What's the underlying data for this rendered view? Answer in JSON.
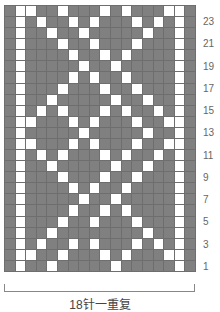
{
  "chart": {
    "columns": 18,
    "rows": 24,
    "colors": {
      "knit": "#808080",
      "contrast": "#ffffff",
      "grid": "#6e6e6e"
    },
    "row_labels": [
      "23",
      "21",
      "19",
      "17",
      "15",
      "13",
      "11",
      "9",
      "7",
      "5",
      "3",
      "1"
    ],
    "white_cells_by_row": {
      "24": [
        2,
        3,
        6,
        10,
        12,
        16,
        17
      ],
      "23": [
        2,
        4,
        7,
        9,
        13,
        15,
        17
      ],
      "22": [
        2,
        5,
        8,
        14,
        17
      ],
      "21": [
        2,
        6,
        9,
        13,
        17
      ],
      "20": [
        2,
        7,
        10,
        12,
        17
      ],
      "19": [
        2,
        8,
        11,
        17
      ],
      "18": [
        2,
        7,
        9,
        12,
        17
      ],
      "17": [
        2,
        6,
        10,
        13,
        17
      ],
      "16": [
        2,
        5,
        11,
        14,
        17
      ],
      "15": [
        2,
        4,
        6,
        10,
        12,
        15,
        17
      ],
      "14": [
        2,
        3,
        7,
        9,
        13,
        16,
        17
      ],
      "13": [
        2,
        8,
        14,
        17
      ],
      "12": [
        2,
        3,
        7,
        9,
        13,
        16,
        17
      ],
      "11": [
        2,
        4,
        6,
        10,
        12,
        15,
        17
      ],
      "10": [
        2,
        5,
        11,
        14,
        17
      ],
      "9": [
        2,
        6,
        10,
        13,
        17
      ],
      "8": [
        2,
        7,
        9,
        12,
        17
      ],
      "7": [
        2,
        8,
        11,
        17
      ],
      "6": [
        2,
        7,
        10,
        12,
        17
      ],
      "5": [
        2,
        6,
        9,
        13,
        17
      ],
      "4": [
        2,
        5,
        14,
        17
      ],
      "3": [
        2,
        4,
        7,
        9,
        13,
        15,
        17
      ],
      "2": [
        2,
        3,
        6,
        10,
        12,
        16,
        17
      ],
      "1": [
        2,
        5,
        11,
        17
      ]
    }
  },
  "caption": "18针一重复"
}
